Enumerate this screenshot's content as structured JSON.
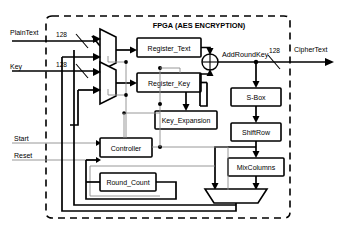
{
  "diagram": {
    "title": "FPGA (AES ENCRYPTION)",
    "boundary_label": "fpga-dashed-boundary",
    "inputs": [
      {
        "id": "plaintext",
        "label": "PlainText",
        "width_label": "128"
      },
      {
        "id": "key",
        "label": "Key",
        "width_label": "128"
      },
      {
        "id": "start",
        "label": "Start",
        "width_label": ""
      },
      {
        "id": "reset",
        "label": "Reset",
        "width_label": ""
      }
    ],
    "outputs": [
      {
        "id": "ciphertext",
        "label": "CipherText",
        "width_label": "128"
      }
    ],
    "blocks": [
      {
        "id": "register_text",
        "label": "Register_Text"
      },
      {
        "id": "register_key",
        "label": "Register_Key"
      },
      {
        "id": "key_expansion",
        "label": "Key_Expansion"
      },
      {
        "id": "controller",
        "label": "Controller"
      },
      {
        "id": "round_count",
        "label": "Round_Count"
      },
      {
        "id": "sbox",
        "label": "S-Box"
      },
      {
        "id": "shiftrow",
        "label": "ShiftRow"
      },
      {
        "id": "mixcolumns",
        "label": "MixColumns"
      }
    ],
    "muxes": [
      {
        "id": "mux-plaintext",
        "label": ""
      },
      {
        "id": "mux-key",
        "label": ""
      },
      {
        "id": "mux-feedback",
        "label": ""
      }
    ],
    "operators": [
      {
        "id": "addroundkey",
        "label": "AddRoundKey",
        "glyph": "xor"
      }
    ],
    "colors": {
      "stroke": "#000000",
      "control_wire": "#8c8c8c",
      "background": "#ffffff"
    }
  }
}
